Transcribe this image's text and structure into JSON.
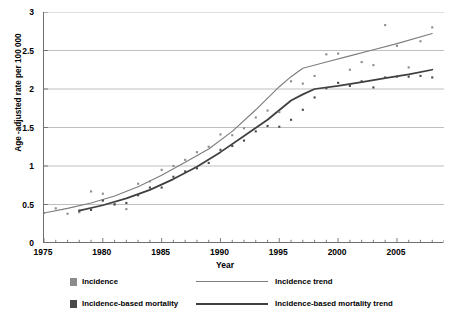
{
  "chart_data": {
    "type": "scatter",
    "title": "",
    "xlabel": "Year",
    "ylabel": "Age -adjusted rate per 100 000",
    "xlim": [
      1975,
      2009
    ],
    "ylim": [
      0,
      3
    ],
    "xticks": [
      1975,
      1980,
      1985,
      1990,
      1995,
      2000,
      2005
    ],
    "yticks": [
      "0",
      "0.5",
      "1",
      "1.5",
      "2",
      "2.5",
      "3"
    ],
    "ytick_values": [
      0,
      0.5,
      1,
      1.5,
      2,
      2.5,
      3
    ],
    "minor_xticks_every": 1,
    "grid": "horizontal",
    "legend_position": "below",
    "colors": {
      "incidence": "#8c8c8c",
      "incidence_trend": "#7d7d7d",
      "mortality": "#4a4a4a",
      "mortality_trend": "#3f3f3f",
      "grid": "#b8b8b8",
      "axis": "#6f6f6f"
    },
    "series": [
      {
        "name": "Incidence",
        "type": "scatter",
        "marker": "square",
        "x": [
          1975,
          1976,
          1977,
          1978,
          1979,
          1980,
          1981,
          1982,
          1983,
          1984,
          1985,
          1986,
          1987,
          1988,
          1989,
          1990,
          1991,
          1992,
          1993,
          1994,
          1995,
          1996,
          1997,
          1998,
          1999,
          2000,
          2001,
          2002,
          2003,
          2004,
          2005,
          2006,
          2007,
          2008
        ],
        "values": [
          0.39,
          0.45,
          0.38,
          0.4,
          0.67,
          0.64,
          0.51,
          0.44,
          0.77,
          0.8,
          0.95,
          1.0,
          1.08,
          1.18,
          1.25,
          1.41,
          1.4,
          1.49,
          1.63,
          1.72,
          1.7,
          2.1,
          2.07,
          2.17,
          2.45,
          2.46,
          2.25,
          2.35,
          2.31,
          2.83,
          2.56,
          2.28,
          2.62,
          2.8
        ]
      },
      {
        "name": "Incidence-based mortality",
        "type": "scatter",
        "marker": "square",
        "x": [
          1978,
          1979,
          1980,
          1981,
          1982,
          1983,
          1984,
          1985,
          1986,
          1987,
          1988,
          1989,
          1990,
          1991,
          1992,
          1993,
          1994,
          1995,
          1996,
          1997,
          1998,
          1999,
          2000,
          2001,
          2002,
          2003,
          2004,
          2005,
          2006,
          2007,
          2008
        ],
        "values": [
          0.42,
          0.43,
          0.55,
          0.5,
          0.52,
          0.62,
          0.72,
          0.72,
          0.86,
          0.93,
          0.97,
          1.04,
          1.21,
          1.26,
          1.33,
          1.45,
          1.52,
          1.51,
          1.6,
          1.73,
          1.89,
          2.01,
          2.08,
          2.04,
          2.1,
          2.02,
          2.15,
          2.16,
          2.16,
          2.17,
          2.15
        ]
      }
    ],
    "trends": [
      {
        "name": "Incidence trend",
        "type": "line",
        "joinpoints": [
          1975,
          1997,
          2008
        ],
        "x": [
          1975,
          1977,
          1979,
          1981,
          1983,
          1985,
          1987,
          1989,
          1991,
          1993,
          1995,
          1996,
          1997,
          1999,
          2001,
          2003,
          2005,
          2008
        ],
        "values": [
          0.39,
          0.45,
          0.52,
          0.61,
          0.73,
          0.88,
          1.05,
          1.22,
          1.45,
          1.73,
          2.03,
          2.16,
          2.27,
          2.35,
          2.43,
          2.51,
          2.59,
          2.72
        ]
      },
      {
        "name": "Incidence-based mortality trend",
        "type": "line",
        "joinpoints": [
          1978,
          1998,
          2008
        ],
        "x": [
          1978,
          1980,
          1982,
          1984,
          1986,
          1988,
          1990,
          1992,
          1994,
          1996,
          1997,
          1998,
          2000,
          2002,
          2004,
          2006,
          2008
        ],
        "values": [
          0.42,
          0.49,
          0.58,
          0.69,
          0.83,
          0.99,
          1.18,
          1.39,
          1.6,
          1.85,
          1.93,
          2.0,
          2.04,
          2.09,
          2.14,
          2.19,
          2.25
        ]
      }
    ]
  },
  "axis": {
    "y_title": "Age -adjusted rate per 100 000",
    "x_title": "Year"
  },
  "legend": {
    "incidence_label": "Incidence",
    "incidence_trend_label": "Incidence trend",
    "mortality_label": "Incidence-based mortality",
    "mortality_trend_label": "Incidence-based mortality trend"
  }
}
